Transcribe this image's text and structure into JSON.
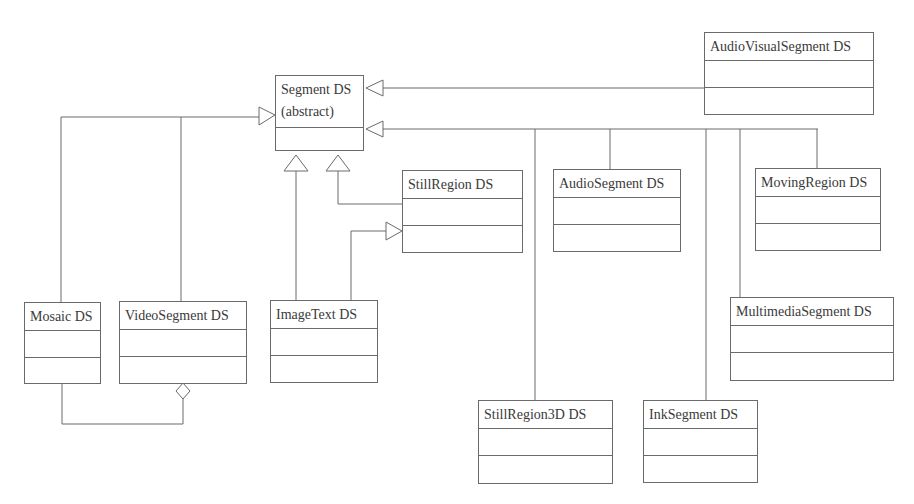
{
  "diagram": {
    "type": "UML class diagram",
    "classes": {
      "segment": {
        "name": "Segment DS",
        "stereotype": "(abstract)"
      },
      "audio_visual_segment": {
        "name": "AudioVisualSegment DS"
      },
      "still_region": {
        "name": "StillRegion DS"
      },
      "audio_segment": {
        "name": "AudioSegment DS"
      },
      "moving_region": {
        "name": "MovingRegion DS"
      },
      "mosaic": {
        "name": "Mosaic DS"
      },
      "video_segment": {
        "name": "VideoSegment DS"
      },
      "image_text": {
        "name": "ImageText DS"
      },
      "multimedia_segment": {
        "name": "MultimediaSegment DS"
      },
      "still_region_3d": {
        "name": "StillRegion3D DS"
      },
      "ink_segment": {
        "name": "InkSegment DS"
      }
    },
    "relationships": [
      {
        "from": "AudioVisualSegment DS",
        "to": "Segment DS",
        "type": "generalization"
      },
      {
        "from": "Mosaic DS",
        "to": "Segment DS",
        "type": "generalization"
      },
      {
        "from": "VideoSegment DS",
        "to": "Segment DS",
        "type": "generalization"
      },
      {
        "from": "ImageText DS",
        "to": "Segment DS",
        "type": "generalization"
      },
      {
        "from": "StillRegion DS",
        "to": "Segment DS",
        "type": "generalization"
      },
      {
        "from": "ImageText DS",
        "to": "StillRegion DS",
        "type": "generalization"
      },
      {
        "from": "AudioSegment DS",
        "to": "Segment DS",
        "type": "generalization"
      },
      {
        "from": "MovingRegion DS",
        "to": "Segment DS",
        "type": "generalization"
      },
      {
        "from": "MultimediaSegment DS",
        "to": "Segment DS",
        "type": "generalization"
      },
      {
        "from": "StillRegion3D DS",
        "to": "Segment DS",
        "type": "generalization"
      },
      {
        "from": "InkSegment DS",
        "to": "Segment DS",
        "type": "generalization"
      },
      {
        "from": "Mosaic DS",
        "to": "VideoSegment DS",
        "type": "aggregation"
      }
    ],
    "colors": {
      "line": "#6a6a6a",
      "text": "#3a3a3a",
      "background": "#ffffff"
    }
  }
}
